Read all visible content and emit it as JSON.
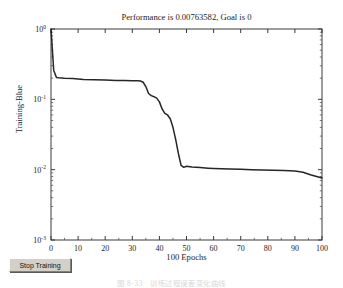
{
  "window": {
    "top_fragment": "",
    "stop_button_label": "Stop Training"
  },
  "caption": {
    "number": "图 8-33",
    "text": "训练过程误差变化曲线"
  },
  "chart_data": {
    "type": "line",
    "title": "Performance is 0.00763582, Goal is 0",
    "xlabel": "100 Epochs",
    "ylabel": "Training-Blue",
    "yscale": "log",
    "xlim": [
      0,
      100
    ],
    "ylim": [
      0.001,
      1
    ],
    "grid": false,
    "legend": null,
    "xticks": [
      "0",
      "10",
      "20",
      "30",
      "40",
      "50",
      "60",
      "70",
      "80",
      "90",
      "100"
    ],
    "xtick_values": [
      0,
      10,
      20,
      30,
      40,
      50,
      60,
      70,
      80,
      90,
      100
    ],
    "yticks": [
      "10^0",
      "10^-1",
      "10^-2",
      "10^-3"
    ],
    "ytick_values": [
      1,
      0.1,
      0.01,
      0.001
    ],
    "line_color": "#262626",
    "series": [
      {
        "name": "Training-Blue",
        "x": [
          0,
          1,
          2,
          3,
          5,
          8,
          12,
          16,
          20,
          24,
          27,
          30,
          32,
          33,
          34,
          35,
          36,
          37,
          38,
          39,
          40,
          41,
          42,
          43,
          44,
          45,
          46,
          47,
          48,
          49,
          50,
          52,
          55,
          58,
          60,
          63,
          66,
          70,
          74,
          78,
          82,
          86,
          90,
          93,
          96,
          98,
          100
        ],
        "values": [
          1.0,
          0.26,
          0.205,
          0.203,
          0.2,
          0.197,
          0.192,
          0.19,
          0.188,
          0.186,
          0.185,
          0.184,
          0.183,
          0.182,
          0.175,
          0.152,
          0.121,
          0.113,
          0.109,
          0.104,
          0.092,
          0.073,
          0.063,
          0.06,
          0.053,
          0.04,
          0.027,
          0.017,
          0.0115,
          0.0108,
          0.0112,
          0.0109,
          0.0107,
          0.0105,
          0.0104,
          0.0103,
          0.0102,
          0.0101,
          0.01,
          0.0099,
          0.0098,
          0.0097,
          0.0096,
          0.0092,
          0.0084,
          0.008,
          0.00763582
        ]
      }
    ],
    "final_performance": "0.00763582",
    "goal": "0"
  }
}
